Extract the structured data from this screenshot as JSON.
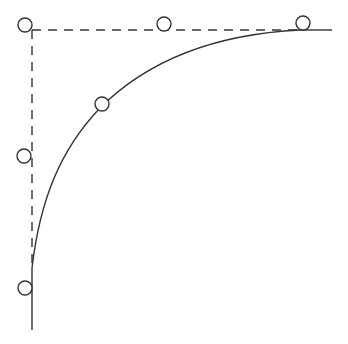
{
  "diagram": {
    "type": "saturation-curve-sketch",
    "colors": {
      "background": "#ffffff",
      "stroke": "#333333"
    },
    "axes": {
      "vertical_dashed": {
        "x": 32,
        "y1": 30,
        "y2": 268
      },
      "vertical_solid": {
        "x": 32,
        "y1": 268,
        "y2": 330
      },
      "horizontal_dashed": {
        "y": 30,
        "x1": 32,
        "x2": 300
      },
      "horizontal_solid": {
        "y": 30,
        "x1": 300,
        "x2": 332
      }
    },
    "curve": {
      "description": "rising concave curve saturating toward the top dashed asymptote",
      "start": [
        32,
        268
      ],
      "end": [
        300,
        30
      ]
    },
    "markers": [
      {
        "cx": 25,
        "cy": 25,
        "r": 7,
        "label": "top-left corner marker"
      },
      {
        "cx": 164,
        "cy": 24,
        "r": 7,
        "label": "top dashed line marker"
      },
      {
        "cx": 303,
        "cy": 23,
        "r": 7,
        "label": "top-right asymptote marker"
      },
      {
        "cx": 102,
        "cy": 104,
        "r": 7,
        "label": "curve marker"
      },
      {
        "cx": 24,
        "cy": 156,
        "r": 7,
        "label": "left dashed line marker"
      },
      {
        "cx": 25,
        "cy": 288,
        "r": 7,
        "label": "bottom-left solid line marker"
      }
    ]
  }
}
